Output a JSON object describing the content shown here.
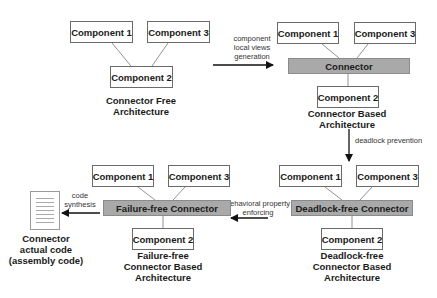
{
  "diagram": {
    "stage1": {
      "components": [
        "Component 1",
        "Component 3",
        "Component 2"
      ],
      "caption": [
        "Connector Free",
        "Architecture"
      ]
    },
    "arrow1": {
      "label": [
        "component",
        "local views",
        "generation"
      ]
    },
    "stage2": {
      "components": [
        "Component 1",
        "Component 3",
        "Component 2"
      ],
      "connector": "Connector",
      "caption": [
        "Connector Based",
        "Architecture"
      ]
    },
    "arrow2": {
      "label": "deadlock prevention"
    },
    "stage3": {
      "components": [
        "Component 1",
        "Component 3",
        "Component 2"
      ],
      "connector": "Deadlock-free Connector",
      "caption": [
        "Deadlock-free",
        "Connector Based",
        "Architecture"
      ]
    },
    "arrow3": {
      "label": [
        "behavioral property",
        "enforcing"
      ]
    },
    "stage4": {
      "components": [
        "Component 1",
        "Component 3",
        "Component 2"
      ],
      "connector": "Failure-free Connector",
      "caption": [
        "Failure-free",
        "Connector Based",
        "Architecture"
      ]
    },
    "arrow4": {
      "label": [
        "code",
        "synthesis"
      ]
    },
    "output": {
      "icon": "document-icon",
      "caption": [
        "Connector",
        "actual code",
        "(assembly code)"
      ]
    }
  }
}
